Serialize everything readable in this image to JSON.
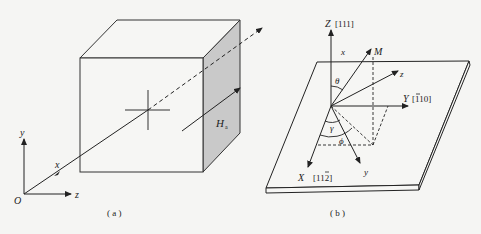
{
  "figure_a": {
    "caption": "( a )",
    "axes": {
      "origin": "O",
      "x": "x",
      "y": "y",
      "z": "z"
    },
    "field_label": "H",
    "field_subscript": "a"
  },
  "figure_b": {
    "caption": "( b )",
    "axes": {
      "Z": "Z [111]",
      "Y": "Y [110]",
      "Y_text": "Y [110]",
      "X": "X  [112]"
    },
    "vector_labels": {
      "M": "M",
      "x": "x",
      "y": "y",
      "z": "z"
    },
    "angles": {
      "theta": "θ",
      "gamma": "γ",
      "phi": "ϕ"
    },
    "overbars": {
      "Y_index": "1 (first digit, negative)",
      "X_index": "2 (last digit, negative)"
    }
  },
  "colors": {
    "line": "#222222",
    "shade": "#c8c8c8",
    "background": "#f5f5f3"
  }
}
